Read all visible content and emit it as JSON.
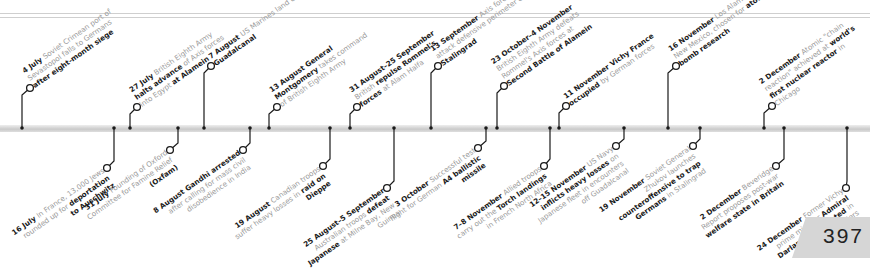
{
  "page_number": "397",
  "timeline": {
    "top_events": [
      {
        "date": "4 July",
        "lines": [
          [
            "",
            "Soviet Crimean"
          ],
          [
            "",
            "port of Sevastopol falls to"
          ],
          [
            "",
            "Germans "
          ],
          [
            "b",
            "after eight-month"
          ],
          [
            "b",
            "siege"
          ]
        ]
      },
      {
        "date": "27 July",
        "lines": [
          [
            "",
            "British Eighth"
          ],
          [
            "",
            "Army "
          ],
          [
            "b",
            "halts advance"
          ],
          [
            "",
            " of"
          ],
          [
            "",
            "Axis forces into Egypt"
          ],
          [
            "b",
            "at Alamein"
          ]
        ]
      },
      {
        "date": "7 August",
        "lines": [
          [
            "",
            "US"
          ],
          [
            "",
            "Marines land on"
          ],
          [
            "b",
            "Guadalcanal"
          ]
        ]
      },
      {
        "date": "13 August General",
        "lines": [
          [
            "b",
            "Montgomery"
          ],
          [
            "",
            " takes"
          ],
          [
            "",
            "command of British"
          ],
          [
            "",
            "Eighth Army"
          ]
        ]
      },
      {
        "date": "31 August–25",
        "lines": [
          [
            "b",
            "September"
          ],
          [
            "",
            " British"
          ],
          [
            "b",
            "repulse Rommel's forces"
          ],
          [
            "",
            "at Alam Halfa"
          ]
        ]
      },
      {
        "date": "13 September",
        "lines": [
          [
            "",
            "Axis forces attack"
          ],
          [
            "",
            "defensive perimeter"
          ],
          [
            "",
            "of "
          ],
          [
            "b",
            "Stalingrad"
          ]
        ]
      },
      {
        "date": "23 October–4 November",
        "lines": [
          [
            "",
            "British Eighth Army defeats"
          ],
          [
            "",
            "Rommel's Axis forces at"
          ],
          [
            "b",
            "Second Battle of Alamein"
          ]
        ]
      },
      {
        "date": "11 November",
        "lines": [
          [
            "b",
            "Vichy France"
          ],
          [
            "b",
            "occupied"
          ],
          [
            "",
            " by German forces"
          ]
        ]
      },
      {
        "date": "16 November",
        "lines": [
          [
            "",
            "Los Alamos, New"
          ],
          [
            "",
            "Mexico, chosen for"
          ],
          [
            "b",
            "atom bomb research"
          ]
        ]
      },
      {
        "date": "2 December",
        "lines": [
          [
            "",
            "Atomic"
          ],
          [
            "",
            "\"chain reaction\" achieved"
          ],
          [
            "",
            "at "
          ],
          [
            "b",
            "world's first nuclear"
          ],
          [
            "b",
            "reactor"
          ],
          [
            "",
            " in Chicago"
          ]
        ]
      }
    ],
    "bottom_events": [
      {
        "date": "16 July",
        "lines": [
          [
            "",
            "In France,"
          ],
          [
            "",
            "13,000 Jews rounded"
          ],
          [
            "",
            "up for "
          ],
          [
            "b",
            "deportation"
          ],
          [
            "b",
            "to Auschwitz"
          ]
        ]
      },
      {
        "date": "31 July",
        "lines": [
          [
            "",
            "Founding of Oxford"
          ],
          [
            "",
            "Committee for Famine Relief"
          ],
          [
            "b",
            "(Oxfam)"
          ]
        ]
      },
      {
        "date": "8 August",
        "lines": [
          [
            "b",
            "Gandhi arrested"
          ],
          [
            "",
            "after calling for mass civil"
          ],
          [
            "",
            "disobedience in India"
          ]
        ]
      },
      {
        "date": "19 August",
        "lines": [
          [
            "",
            "Canadian"
          ],
          [
            "",
            "troops suffer heavy"
          ],
          [
            "",
            "losses in "
          ],
          [
            "b",
            "raid on Dieppe"
          ]
        ]
      },
      {
        "date": "25 August–5 September",
        "lines": [
          [
            "",
            "Australian troops "
          ],
          [
            "b",
            "defeat"
          ],
          [
            "b",
            "Japanese"
          ],
          [
            "",
            " at Milne Bay,"
          ],
          [
            "",
            "New Guinea"
          ]
        ]
      },
      {
        "date": "3 October",
        "lines": [
          [
            "",
            "Successful test flight"
          ],
          [
            "",
            "for German "
          ],
          [
            "b",
            "A4 ballistic missile"
          ]
        ]
      },
      {
        "date": "7–8 November",
        "lines": [
          [
            "",
            "Allied troops"
          ],
          [
            "",
            "carry out the "
          ],
          [
            "b",
            "Torch landings"
          ],
          [
            "",
            "in French North Africa"
          ]
        ]
      },
      {
        "date": "12–15 November",
        "lines": [
          [
            "",
            "US Navy "
          ],
          [
            "b",
            "inflicts"
          ],
          [
            "b",
            "heavy losses"
          ],
          [
            "",
            " on Japanese fleet in"
          ],
          [
            "",
            "encounters off Guadalcanal"
          ]
        ]
      },
      {
        "date": "19 November",
        "lines": [
          [
            "",
            "Soviet General Zhukov"
          ],
          [
            "",
            "launches "
          ],
          [
            "b",
            "counteroffensive to trap"
          ],
          [
            "b",
            "Germans"
          ],
          [
            "",
            " in Stalingrad"
          ]
        ]
      },
      {
        "date": "2 December",
        "lines": [
          [
            "",
            "Beveridge"
          ],
          [
            "",
            "Report proposes post-war"
          ],
          [
            "b",
            "welfare state in Britain"
          ]
        ]
      },
      {
        "date": "24 December",
        "lines": [
          [
            "",
            "Former Vichy"
          ],
          [
            "",
            "prime minister "
          ],
          [
            "b",
            "Admiral"
          ],
          [
            "b",
            "Darlan assassinated"
          ],
          [
            "",
            "in Algiers"
          ]
        ]
      }
    ]
  },
  "geometry": {
    "top": [
      [
        22,
        30,
        88
      ],
      [
        130,
        137,
        107
      ],
      [
        204,
        211,
        66
      ],
      [
        269,
        277,
        107
      ],
      [
        350,
        357,
        107
      ],
      [
        431,
        438,
        66
      ],
      [
        497,
        504,
        86
      ],
      [
        559,
        566,
        106
      ],
      [
        668,
        676,
        66
      ],
      [
        764,
        772,
        106
      ]
    ],
    "bottom": [
      [
        114,
        107,
        168
      ],
      [
        178,
        170,
        150
      ],
      [
        250,
        243,
        150
      ],
      [
        330,
        323,
        166
      ],
      [
        394,
        387,
        188
      ],
      [
        486,
        478,
        148
      ],
      [
        550,
        544,
        166
      ],
      [
        624,
        616,
        146
      ],
      [
        700,
        693,
        146
      ],
      [
        784,
        776,
        166
      ],
      [
        847,
        846,
        188
      ]
    ]
  },
  "colors": {
    "bar": "#d0d0d0",
    "ink": "#1a1a1a",
    "gray_text": "#9a9a9a",
    "page_tab": "#d6d6d6"
  }
}
